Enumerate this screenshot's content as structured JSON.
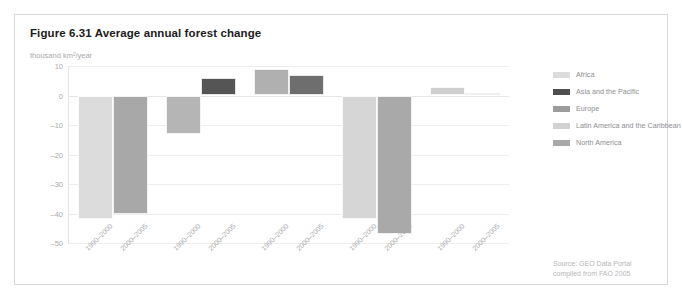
{
  "figure": {
    "title": "Figure 6.31 Average annual forest change",
    "unit_label": "thousand km²/year",
    "source_line_1": "Source: GEO Data Portal",
    "source_line_2": "compiled from FAO 2005"
  },
  "colors": {
    "card_border": "#d8d8dc",
    "gridline": "#eeeef0",
    "axis_text": "#a9a9ad",
    "title_text": "#1b1b1b",
    "africa": "#dcdcdc",
    "asia_pacific": "#4f4f4f",
    "europe": "#9c9c9c",
    "latin_america_caribbean": "#d2d2d2",
    "north_america": "#a8a8a8"
  },
  "legend": {
    "items": [
      {
        "label": "Africa",
        "color": "#dcdcdc"
      },
      {
        "label": "Asia and the Pacific",
        "color": "#4f4f4f"
      },
      {
        "label": "Europe",
        "color": "#9c9c9c"
      },
      {
        "label": "Latin America and the Caribbean",
        "color": "#d2d2d2"
      },
      {
        "label": "North America",
        "color": "#a8a8a8"
      }
    ]
  },
  "chart_data": {
    "type": "bar",
    "title": "Figure 6.31 Average annual forest change",
    "subtitle": "",
    "xlabel": "",
    "ylabel": "thousand km²/year",
    "ylim": [
      -50,
      10
    ],
    "yticks": [
      10,
      0,
      -10,
      -20,
      -30,
      -40,
      -50
    ],
    "ytick_labels": [
      "10",
      "0",
      "–10",
      "–20",
      "–30",
      "–40",
      "–50"
    ],
    "grid": true,
    "legend_position": "right",
    "categories": [
      "1990–2000",
      "2000–2005"
    ],
    "groups": [
      {
        "name": "Africa",
        "color": "#dcdcdc",
        "bars": [
          {
            "period": "1990–2000",
            "value": -42
          },
          {
            "period": "2000–2005",
            "value": -40
          }
        ]
      },
      {
        "name": "Asia and the Pacific",
        "color": "#4f4f4f",
        "bars": [
          {
            "period": "1990–2000",
            "value": -13
          },
          {
            "period": "2000–2005",
            "value": 6
          }
        ]
      },
      {
        "name": "Europe",
        "color": "#9c9c9c",
        "bars": [
          {
            "period": "1990–2000",
            "value": 9
          },
          {
            "period": "2000–2005",
            "value": 7
          }
        ]
      },
      {
        "name": "Latin America and the Caribbean",
        "color": "#d2d2d2",
        "bars": [
          {
            "period": "1990–2000",
            "value": -42
          },
          {
            "period": "2000–2005",
            "value": -47
          }
        ]
      },
      {
        "name": "North America",
        "color": "#a8a8a8",
        "bars": [
          {
            "period": "1990–2000",
            "value": 3
          },
          {
            "period": "2000–2005",
            "value": 1
          }
        ]
      }
    ],
    "bar_colors": [
      [
        "#dcdcdc",
        "#a8a8a8"
      ],
      [
        "#b5b5b5",
        "#555555"
      ],
      [
        "#b0b0b0",
        "#6e6e6e"
      ],
      [
        "#d6d6d6",
        "#a9a9a9"
      ],
      [
        "#cfcfcf",
        "#9e9e9e"
      ]
    ],
    "x_tick_labels": [
      "1990–2000",
      "2000–2005",
      "1990–2000",
      "2000–2005",
      "1990–2000",
      "2000–2005",
      "1990–2000",
      "2000–2005",
      "1990–2000",
      "2000–2005"
    ]
  }
}
